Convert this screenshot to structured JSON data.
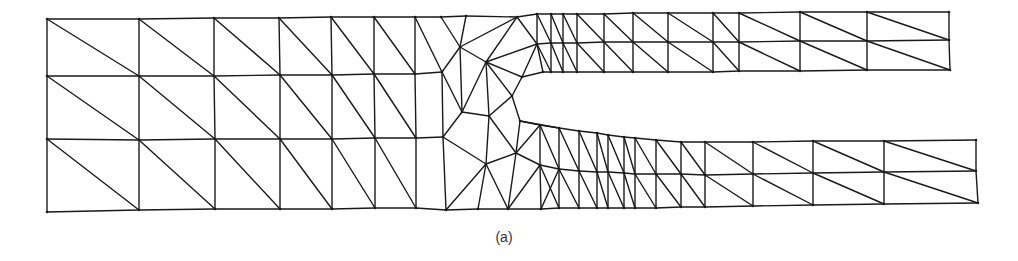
{
  "figure": {
    "caption": "(a)",
    "stroke_color": "#1a1a1a",
    "background": "#ffffff"
  },
  "mesh": {
    "nodes": {
      "L0a": [
        47,
        19
      ],
      "L0b": [
        47,
        76
      ],
      "L0c": [
        47,
        139
      ],
      "L0d": [
        47,
        212
      ],
      "L1a": [
        139,
        19
      ],
      "L1b": [
        139,
        76
      ],
      "L1c": [
        139,
        140
      ],
      "L1d": [
        139,
        210
      ],
      "L2a": [
        214,
        18
      ],
      "L2b": [
        214,
        76
      ],
      "L2c": [
        215,
        139
      ],
      "L2d": [
        215,
        209
      ],
      "L3a": [
        279,
        18
      ],
      "L3b": [
        280,
        75
      ],
      "L3c": [
        280,
        139
      ],
      "L3d": [
        280,
        209
      ],
      "L4a": [
        331,
        17
      ],
      "L4b": [
        332,
        75
      ],
      "L4c": [
        332,
        139
      ],
      "L4d": [
        332,
        209
      ],
      "L5a": [
        374,
        17
      ],
      "L5b": [
        374,
        74
      ],
      "L5c": [
        375,
        138
      ],
      "L5d": [
        375,
        208
      ],
      "L6a": [
        415,
        17
      ],
      "L6b": [
        415,
        74
      ],
      "L6c": [
        416,
        138
      ],
      "L6d": [
        416,
        208
      ],
      "C01": [
        441,
        17
      ],
      "C02": [
        442,
        72
      ],
      "C03": [
        466,
        16
      ],
      "C04": [
        460,
        47
      ],
      "C05": [
        486,
        62
      ],
      "C06": [
        517,
        17
      ],
      "C07": [
        537,
        44
      ],
      "C08": [
        522,
        77
      ],
      "C09": [
        512,
        96
      ],
      "C10": [
        462,
        112
      ],
      "C11": [
        489,
        116
      ],
      "C12": [
        443,
        137
      ],
      "C13": [
        486,
        164
      ],
      "C14": [
        516,
        153
      ],
      "C15": [
        446,
        210
      ],
      "C16": [
        478,
        209
      ],
      "C17": [
        508,
        209
      ],
      "C18": [
        520,
        121
      ],
      "C19": [
        540,
        125
      ],
      "C20": [
        540,
        165
      ],
      "C21": [
        541,
        209
      ],
      "U01": [
        537,
        14
      ],
      "U02": [
        551,
        14
      ],
      "U03": [
        563,
        14
      ],
      "U04": [
        577,
        14
      ],
      "U05": [
        604,
        14
      ],
      "U06": [
        633,
        13
      ],
      "U07": [
        668,
        13
      ],
      "U08": [
        713,
        13
      ],
      "U09": [
        739,
        13
      ],
      "U10": [
        800,
        12
      ],
      "U11": [
        867,
        12
      ],
      "U12": [
        949,
        12
      ],
      "V02": [
        551,
        43
      ],
      "V03": [
        563,
        43
      ],
      "V04": [
        577,
        43
      ],
      "V05": [
        604,
        42
      ],
      "V06": [
        633,
        42
      ],
      "V07": [
        668,
        42
      ],
      "V08": [
        713,
        42
      ],
      "V09": [
        739,
        42
      ],
      "V10": [
        800,
        41
      ],
      "V11": [
        867,
        41
      ],
      "V12": [
        949,
        40
      ],
      "W01": [
        543,
        72
      ],
      "W02": [
        551,
        72
      ],
      "W03": [
        563,
        72
      ],
      "W04": [
        577,
        72
      ],
      "W05": [
        604,
        72
      ],
      "W06": [
        633,
        72
      ],
      "W07": [
        668,
        72
      ],
      "W08": [
        713,
        72
      ],
      "W09": [
        739,
        71
      ],
      "W10": [
        800,
        71
      ],
      "W11": [
        867,
        70
      ],
      "W12": [
        950,
        70
      ],
      "P01": [
        559,
        128
      ],
      "P02": [
        579,
        131
      ],
      "P03": [
        597,
        133
      ],
      "P04": [
        608,
        135
      ],
      "P05": [
        624,
        137
      ],
      "P06": [
        635,
        138
      ],
      "P07": [
        656,
        140
      ],
      "P08": [
        681,
        142
      ],
      "P09": [
        705,
        142
      ],
      "P10": [
        753,
        142
      ],
      "P11": [
        813,
        141
      ],
      "P12": [
        884,
        141
      ],
      "P13": [
        976,
        140
      ],
      "Q01": [
        559,
        169
      ],
      "Q02": [
        579,
        171
      ],
      "Q03": [
        597,
        172
      ],
      "Q04": [
        608,
        172
      ],
      "Q05": [
        624,
        173
      ],
      "Q06": [
        635,
        174
      ],
      "Q07": [
        656,
        174
      ],
      "Q08": [
        681,
        174
      ],
      "Q09": [
        705,
        175
      ],
      "Q10": [
        753,
        174
      ],
      "Q11": [
        813,
        173
      ],
      "Q12": [
        884,
        172
      ],
      "Q13": [
        976,
        171
      ],
      "R01": [
        559,
        208
      ],
      "R02": [
        579,
        208
      ],
      "R03": [
        597,
        208
      ],
      "R04": [
        608,
        208
      ],
      "R05": [
        624,
        208
      ],
      "R06": [
        635,
        208
      ],
      "R07": [
        656,
        208
      ],
      "R08": [
        681,
        207
      ],
      "R09": [
        705,
        207
      ],
      "R10": [
        753,
        206
      ],
      "R11": [
        813,
        205
      ],
      "R12": [
        884,
        204
      ],
      "R13": [
        978,
        203
      ]
    },
    "edges": [
      [
        "L0a",
        "L1a"
      ],
      [
        "L1a",
        "L2a"
      ],
      [
        "L2a",
        "L3a"
      ],
      [
        "L3a",
        "L4a"
      ],
      [
        "L4a",
        "L5a"
      ],
      [
        "L5a",
        "L6a"
      ],
      [
        "L6a",
        "C01"
      ],
      [
        "C01",
        "C03"
      ],
      [
        "C03",
        "C06"
      ],
      [
        "C06",
        "U01"
      ],
      [
        "L0b",
        "L1b"
      ],
      [
        "L1b",
        "L2b"
      ],
      [
        "L2b",
        "L3b"
      ],
      [
        "L3b",
        "L4b"
      ],
      [
        "L4b",
        "L5b"
      ],
      [
        "L5b",
        "L6b"
      ],
      [
        "L6b",
        "C02"
      ],
      [
        "L0c",
        "L1c"
      ],
      [
        "L1c",
        "L2c"
      ],
      [
        "L2c",
        "L3c"
      ],
      [
        "L3c",
        "L4c"
      ],
      [
        "L4c",
        "L5c"
      ],
      [
        "L5c",
        "L6c"
      ],
      [
        "L6c",
        "C12"
      ],
      [
        "L0d",
        "L1d"
      ],
      [
        "L1d",
        "L2d"
      ],
      [
        "L2d",
        "L3d"
      ],
      [
        "L3d",
        "L4d"
      ],
      [
        "L4d",
        "L5d"
      ],
      [
        "L5d",
        "L6d"
      ],
      [
        "L6d",
        "C15"
      ],
      [
        "C15",
        "C16"
      ],
      [
        "C16",
        "C17"
      ],
      [
        "C17",
        "C21"
      ],
      [
        "C21",
        "R01"
      ],
      [
        "L0a",
        "L0b"
      ],
      [
        "L0b",
        "L0c"
      ],
      [
        "L0c",
        "L0d"
      ],
      [
        "L1a",
        "L1b"
      ],
      [
        "L1b",
        "L1c"
      ],
      [
        "L1c",
        "L1d"
      ],
      [
        "L2a",
        "L2b"
      ],
      [
        "L2b",
        "L2c"
      ],
      [
        "L2c",
        "L2d"
      ],
      [
        "L3a",
        "L3b"
      ],
      [
        "L3b",
        "L3c"
      ],
      [
        "L3c",
        "L3d"
      ],
      [
        "L4a",
        "L4b"
      ],
      [
        "L4b",
        "L4c"
      ],
      [
        "L4c",
        "L4d"
      ],
      [
        "L5a",
        "L5b"
      ],
      [
        "L5b",
        "L5c"
      ],
      [
        "L5c",
        "L5d"
      ],
      [
        "L6a",
        "L6b"
      ],
      [
        "L6b",
        "L6c"
      ],
      [
        "L6c",
        "L6d"
      ],
      [
        "L0a",
        "L1b"
      ],
      [
        "L1a",
        "L2b"
      ],
      [
        "L2a",
        "L3b"
      ],
      [
        "L3a",
        "L4b"
      ],
      [
        "L4a",
        "L5b"
      ],
      [
        "L5a",
        "L6b"
      ],
      [
        "L0b",
        "L1c"
      ],
      [
        "L1b",
        "L2c"
      ],
      [
        "L2b",
        "L3c"
      ],
      [
        "L3b",
        "L4c"
      ],
      [
        "L4b",
        "L5c"
      ],
      [
        "L5b",
        "L6c"
      ],
      [
        "L0c",
        "L1d"
      ],
      [
        "L1c",
        "L2d"
      ],
      [
        "L2c",
        "L3d"
      ],
      [
        "L3c",
        "L4d"
      ],
      [
        "L4c",
        "L5d"
      ],
      [
        "L5c",
        "L6d"
      ],
      [
        "L6a",
        "C02"
      ],
      [
        "C01",
        "C04"
      ],
      [
        "C03",
        "C04"
      ],
      [
        "C04",
        "C02"
      ],
      [
        "C04",
        "C06"
      ],
      [
        "C04",
        "C05"
      ],
      [
        "C05",
        "C06"
      ],
      [
        "C06",
        "C07"
      ],
      [
        "C05",
        "C07"
      ],
      [
        "C05",
        "C08"
      ],
      [
        "C07",
        "C08"
      ],
      [
        "C08",
        "C09"
      ],
      [
        "C07",
        "W01"
      ],
      [
        "C08",
        "W01"
      ],
      [
        "C02",
        "C10"
      ],
      [
        "C04",
        "C10"
      ],
      [
        "C05",
        "C10"
      ],
      [
        "C05",
        "C11"
      ],
      [
        "C10",
        "C11"
      ],
      [
        "C11",
        "C09"
      ],
      [
        "C09",
        "C18"
      ],
      [
        "C05",
        "C09"
      ],
      [
        "C02",
        "C12"
      ],
      [
        "C10",
        "C12"
      ],
      [
        "C12",
        "C13"
      ],
      [
        "C12",
        "C15"
      ],
      [
        "C13",
        "C15"
      ],
      [
        "C13",
        "C16"
      ],
      [
        "C13",
        "C11"
      ],
      [
        "C11",
        "C14"
      ],
      [
        "C14",
        "C13"
      ],
      [
        "C14",
        "C17"
      ],
      [
        "C13",
        "C17"
      ],
      [
        "C14",
        "C18"
      ],
      [
        "C18",
        "C19"
      ],
      [
        "C14",
        "C19"
      ],
      [
        "C14",
        "C20"
      ],
      [
        "C19",
        "C20"
      ],
      [
        "C20",
        "C17"
      ],
      [
        "C20",
        "C21"
      ],
      [
        "C18",
        "P01"
      ],
      [
        "C19",
        "P01"
      ],
      [
        "C20",
        "Q01"
      ],
      [
        "C19",
        "Q01"
      ],
      [
        "L6c",
        "C12"
      ],
      [
        "U01",
        "U02"
      ],
      [
        "U02",
        "U03"
      ],
      [
        "U03",
        "U04"
      ],
      [
        "U04",
        "U05"
      ],
      [
        "U05",
        "U06"
      ],
      [
        "U06",
        "U07"
      ],
      [
        "U07",
        "U08"
      ],
      [
        "U08",
        "U09"
      ],
      [
        "U09",
        "U10"
      ],
      [
        "U10",
        "U11"
      ],
      [
        "U11",
        "U12"
      ],
      [
        "C07",
        "V02"
      ],
      [
        "V02",
        "V03"
      ],
      [
        "V03",
        "V04"
      ],
      [
        "V04",
        "V05"
      ],
      [
        "V05",
        "V06"
      ],
      [
        "V06",
        "V07"
      ],
      [
        "V07",
        "V08"
      ],
      [
        "V08",
        "V09"
      ],
      [
        "V09",
        "V10"
      ],
      [
        "V10",
        "V11"
      ],
      [
        "V11",
        "V12"
      ],
      [
        "W01",
        "W02"
      ],
      [
        "W02",
        "W03"
      ],
      [
        "W03",
        "W04"
      ],
      [
        "W04",
        "W05"
      ],
      [
        "W05",
        "W06"
      ],
      [
        "W06",
        "W07"
      ],
      [
        "W07",
        "W08"
      ],
      [
        "W08",
        "W09"
      ],
      [
        "W09",
        "W10"
      ],
      [
        "W10",
        "W11"
      ],
      [
        "W11",
        "W12"
      ],
      [
        "U01",
        "C07"
      ],
      [
        "U02",
        "V02"
      ],
      [
        "V02",
        "W02"
      ],
      [
        "U03",
        "V03"
      ],
      [
        "V03",
        "W03"
      ],
      [
        "U04",
        "V04"
      ],
      [
        "V04",
        "W04"
      ],
      [
        "U05",
        "V05"
      ],
      [
        "V05",
        "W05"
      ],
      [
        "U06",
        "V06"
      ],
      [
        "V06",
        "W06"
      ],
      [
        "U07",
        "V07"
      ],
      [
        "V07",
        "W07"
      ],
      [
        "U08",
        "V08"
      ],
      [
        "V08",
        "W08"
      ],
      [
        "U09",
        "V09"
      ],
      [
        "V09",
        "W09"
      ],
      [
        "U10",
        "V10"
      ],
      [
        "V10",
        "W10"
      ],
      [
        "U11",
        "V11"
      ],
      [
        "V11",
        "W11"
      ],
      [
        "U12",
        "V12"
      ],
      [
        "V12",
        "W12"
      ],
      [
        "U01",
        "V02"
      ],
      [
        "U02",
        "V03"
      ],
      [
        "U03",
        "V04"
      ],
      [
        "U04",
        "V05"
      ],
      [
        "U05",
        "V06"
      ],
      [
        "U06",
        "V07"
      ],
      [
        "U07",
        "V08"
      ],
      [
        "U08",
        "V09"
      ],
      [
        "U09",
        "V10"
      ],
      [
        "U10",
        "V11"
      ],
      [
        "U11",
        "V12"
      ],
      [
        "C07",
        "W02"
      ],
      [
        "V02",
        "W03"
      ],
      [
        "V03",
        "W04"
      ],
      [
        "V04",
        "W05"
      ],
      [
        "V05",
        "W06"
      ],
      [
        "V06",
        "W07"
      ],
      [
        "V07",
        "W08"
      ],
      [
        "V08",
        "W09"
      ],
      [
        "V09",
        "W10"
      ],
      [
        "V10",
        "W11"
      ],
      [
        "V11",
        "W12"
      ],
      [
        "C18",
        "P01"
      ],
      [
        "P01",
        "P02"
      ],
      [
        "P02",
        "P03"
      ],
      [
        "P03",
        "P04"
      ],
      [
        "P04",
        "P05"
      ],
      [
        "P05",
        "P06"
      ],
      [
        "P06",
        "P07"
      ],
      [
        "P07",
        "P08"
      ],
      [
        "P08",
        "P09"
      ],
      [
        "P09",
        "P10"
      ],
      [
        "P10",
        "P11"
      ],
      [
        "P11",
        "P12"
      ],
      [
        "P12",
        "P13"
      ],
      [
        "Q01",
        "Q02"
      ],
      [
        "Q02",
        "Q03"
      ],
      [
        "Q03",
        "Q04"
      ],
      [
        "Q04",
        "Q05"
      ],
      [
        "Q05",
        "Q06"
      ],
      [
        "Q06",
        "Q07"
      ],
      [
        "Q07",
        "Q08"
      ],
      [
        "Q08",
        "Q09"
      ],
      [
        "Q09",
        "Q10"
      ],
      [
        "Q10",
        "Q11"
      ],
      [
        "Q11",
        "Q12"
      ],
      [
        "Q12",
        "Q13"
      ],
      [
        "R01",
        "R02"
      ],
      [
        "R02",
        "R03"
      ],
      [
        "R03",
        "R04"
      ],
      [
        "R04",
        "R05"
      ],
      [
        "R05",
        "R06"
      ],
      [
        "R06",
        "R07"
      ],
      [
        "R07",
        "R08"
      ],
      [
        "R08",
        "R09"
      ],
      [
        "R09",
        "R10"
      ],
      [
        "R10",
        "R11"
      ],
      [
        "R11",
        "R12"
      ],
      [
        "R12",
        "R13"
      ],
      [
        "P01",
        "Q01"
      ],
      [
        "Q01",
        "R01"
      ],
      [
        "P02",
        "Q02"
      ],
      [
        "Q02",
        "R02"
      ],
      [
        "P03",
        "Q03"
      ],
      [
        "Q03",
        "R03"
      ],
      [
        "P04",
        "Q04"
      ],
      [
        "Q04",
        "R04"
      ],
      [
        "P05",
        "Q05"
      ],
      [
        "Q05",
        "R05"
      ],
      [
        "P06",
        "Q06"
      ],
      [
        "Q06",
        "R06"
      ],
      [
        "P07",
        "Q07"
      ],
      [
        "Q07",
        "R07"
      ],
      [
        "P08",
        "Q08"
      ],
      [
        "Q08",
        "R08"
      ],
      [
        "P09",
        "Q09"
      ],
      [
        "Q09",
        "R09"
      ],
      [
        "P10",
        "Q10"
      ],
      [
        "Q10",
        "R10"
      ],
      [
        "P11",
        "Q11"
      ],
      [
        "Q11",
        "R11"
      ],
      [
        "P12",
        "Q12"
      ],
      [
        "Q12",
        "R12"
      ],
      [
        "P13",
        "Q13"
      ],
      [
        "Q13",
        "R13"
      ],
      [
        "P01",
        "Q02"
      ],
      [
        "P02",
        "Q03"
      ],
      [
        "P03",
        "Q04"
      ],
      [
        "P04",
        "Q05"
      ],
      [
        "P05",
        "Q06"
      ],
      [
        "P06",
        "Q07"
      ],
      [
        "P07",
        "Q08"
      ],
      [
        "P08",
        "Q09"
      ],
      [
        "P09",
        "Q10"
      ],
      [
        "P10",
        "Q11"
      ],
      [
        "P11",
        "Q12"
      ],
      [
        "P12",
        "Q13"
      ],
      [
        "Q01",
        "R02"
      ],
      [
        "Q02",
        "R03"
      ],
      [
        "Q03",
        "R04"
      ],
      [
        "Q04",
        "R05"
      ],
      [
        "Q05",
        "R06"
      ],
      [
        "Q06",
        "R07"
      ],
      [
        "Q07",
        "R08"
      ],
      [
        "Q08",
        "R09"
      ],
      [
        "Q09",
        "R10"
      ],
      [
        "Q10",
        "R11"
      ],
      [
        "Q11",
        "R12"
      ],
      [
        "Q12",
        "R13"
      ],
      [
        "C21",
        "Q01"
      ],
      [
        "C20",
        "R01"
      ]
    ]
  }
}
